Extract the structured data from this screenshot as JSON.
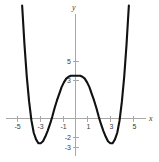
{
  "figure": {
    "background_color": "#ffffff",
    "curve_color": "#111111",
    "axis_color": "#a8a8a8",
    "label_color": "#3b3b3b"
  },
  "axes": {
    "x_axis_name": "x",
    "y_axis_name": "y"
  },
  "labels": {
    "x": {
      "neg5": "-5",
      "neg3": "-3",
      "neg1": "-1",
      "pos1": "1",
      "pos3": "3",
      "pos5": "5"
    },
    "y": {
      "pos5": "5",
      "pos3": "3",
      "neg2": "-2",
      "neg3": "-3"
    }
  },
  "chart_data": {
    "type": "line",
    "title": "",
    "subtitle": "",
    "xlabel": "x",
    "ylabel": "y",
    "xlim": [
      -5.8,
      5.8
    ],
    "ylim": [
      -3.6,
      9.5
    ],
    "grid": false,
    "legend": null,
    "xticks": [
      -5,
      -3,
      -1,
      1,
      3,
      5
    ],
    "xticklabels": [
      "-5",
      "-3",
      "-1",
      "1",
      "3",
      "5"
    ],
    "yticks": [
      5,
      3,
      -2,
      -3
    ],
    "yticklabels": [
      "5",
      "3",
      "-2",
      "-3"
    ],
    "features": {
      "local_maximum": {
        "x": 0,
        "y": 4.5
      },
      "local_minima": [
        {
          "x": -3.0,
          "y": -2.3
        },
        {
          "x": 3.0,
          "y": -2.3
        }
      ],
      "x_intercepts": [
        -4.0,
        -2.0,
        2.0,
        4.0
      ],
      "y_intercept": 4.5,
      "symmetry": "even (about the y-axis)",
      "end_behavior": "rises to +infinity on both ends"
    },
    "series": [
      {
        "name": "f(x)",
        "x": [
          -5.0,
          -4.8,
          -4.6,
          -4.4,
          -4.2,
          -4.0,
          -3.8,
          -3.6,
          -3.4,
          -3.2,
          -3.0,
          -2.8,
          -2.6,
          -2.4,
          -2.2,
          -2.0,
          -1.8,
          -1.6,
          -1.4,
          -1.2,
          -1.0,
          -0.8,
          -0.6,
          -0.4,
          -0.2,
          0.0,
          0.2,
          0.4,
          0.6,
          0.8,
          1.0,
          1.2,
          1.4,
          1.6,
          1.8,
          2.0,
          2.2,
          2.4,
          2.6,
          2.8,
          3.0,
          3.2,
          3.4,
          3.6,
          3.8,
          4.0,
          4.2,
          4.4,
          4.6,
          4.8,
          5.0
        ],
        "y": [
          23.1,
          17.0,
          11.9,
          7.8,
          4.4,
          1.8,
          -0.2,
          -1.5,
          -2.2,
          -2.6,
          -2.6,
          -2.4,
          -1.9,
          -1.3,
          -0.6,
          0.2,
          1.1,
          1.9,
          2.6,
          3.3,
          3.8,
          4.2,
          4.4,
          4.5,
          4.5,
          4.5,
          4.5,
          4.5,
          4.4,
          4.2,
          3.8,
          3.3,
          2.6,
          1.9,
          1.1,
          0.2,
          -0.6,
          -1.3,
          -1.9,
          -2.4,
          -2.6,
          -2.6,
          -2.2,
          -1.5,
          -0.2,
          1.8,
          4.4,
          7.8,
          11.9,
          17.0,
          23.1
        ]
      }
    ]
  }
}
